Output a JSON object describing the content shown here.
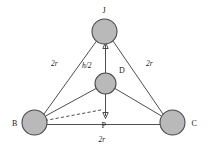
{
  "figure": {
    "background_color": "#ffffff",
    "line_color": "#3b3b3b",
    "sphere_fill": "#b9b9b9",
    "sphere_stroke": "#4a4a4a"
  },
  "vertices": {
    "apex": {
      "id": "J",
      "label": "J",
      "cx": 104.5,
      "cy": 31.5,
      "r": 12.5
    },
    "center": {
      "id": "D",
      "label": "D",
      "cx": 105.5,
      "cy": 83.5,
      "r": 10.5
    },
    "left": {
      "id": "B",
      "label": "B",
      "cx": 34.5,
      "cy": 122.5,
      "r": 12.5
    },
    "right": {
      "id": "C",
      "label": "C",
      "cx": 172.5,
      "cy": 122.5,
      "r": 12.5
    },
    "foot": {
      "id": "P",
      "label": "P",
      "cx": 105.5,
      "cy": 117.0,
      "r": 0
    }
  },
  "vertex_label_positions": {
    "J": {
      "x": 102.5,
      "y": 12.5
    },
    "D": {
      "x": 119.0,
      "y": 73.0
    },
    "B": {
      "x": 12.0,
      "y": 125.5
    },
    "C": {
      "x": 191.5,
      "y": 125.5
    },
    "P": {
      "x": 101.5,
      "y": 127.5
    }
  },
  "measures": [
    {
      "name": "edge-B-J",
      "label": "2r",
      "x": 51.0,
      "y": 66.0
    },
    {
      "name": "edge-C-J",
      "label": "2r",
      "x": 146.0,
      "y": 66.0
    },
    {
      "name": "edge-B-C",
      "label": "2r",
      "x": 98.5,
      "y": 142.0
    },
    {
      "name": "height-half",
      "label": "h/2",
      "x": 82.0,
      "y": 67.5
    }
  ],
  "edges": [
    {
      "name": "edge-B-J",
      "style": "solid",
      "x1": 44.0,
      "y1": 114.0,
      "x2": 96.0,
      "y2": 41.0
    },
    {
      "name": "edge-C-J",
      "style": "solid",
      "x1": 163.0,
      "y1": 114.0,
      "x2": 113.5,
      "y2": 41.0
    },
    {
      "name": "edge-B-C",
      "style": "solid",
      "x1": 47.0,
      "y1": 124.5,
      "x2": 160.0,
      "y2": 124.5
    },
    {
      "name": "edge-B-D",
      "style": "solid",
      "x1": 45.5,
      "y1": 116.0,
      "x2": 96.0,
      "y2": 88.5
    },
    {
      "name": "edge-C-D",
      "style": "solid",
      "x1": 161.5,
      "y1": 116.0,
      "x2": 115.0,
      "y2": 88.5
    },
    {
      "name": "edge-B-P",
      "style": "dashed",
      "x1": 45.0,
      "y1": 120.5,
      "x2": 104.0,
      "y2": 109.0
    }
  ],
  "axis": {
    "name": "vertical-axis-P-to-J",
    "x": 105.5,
    "top_y": 44.0,
    "bottom_y": 117.0,
    "arrow_up_at": "J",
    "arrow_down_at": "P"
  }
}
